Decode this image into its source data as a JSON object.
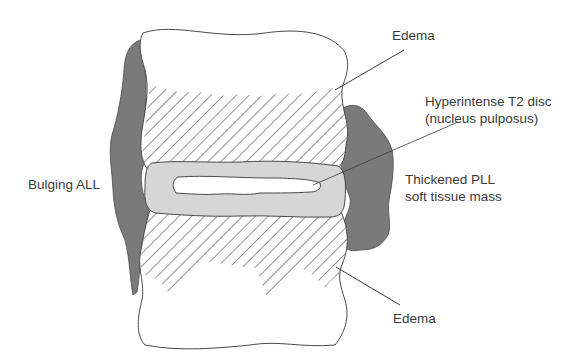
{
  "diagram": {
    "colors": {
      "background": "#ffffff",
      "ligament_dark": "#7a7a7a",
      "disc_annulus": "#d6d6d6",
      "nucleus": "#ffffff",
      "outline": "#4a4a4a",
      "hatch": "#5a5a5a",
      "text": "#3a3a3a"
    },
    "labels": {
      "edema_top": "Edema",
      "hyperintense_line1": "Hyperintense T2 disc",
      "hyperintense_line2": "(nucleus pulposus)",
      "thickened_line1": "Thickened PLL",
      "thickened_line2": "soft tissue mass",
      "bulging_all": "Bulging ALL",
      "edema_bottom": "Edema"
    },
    "structures": [
      "upper-vertebral-body",
      "lower-vertebral-body",
      "intervertebral-disc",
      "nucleus-pulposus",
      "anterior-longitudinal-ligament",
      "posterior-longitudinal-ligament-mass",
      "edema-hatched-region-upper",
      "edema-hatched-region-lower"
    ]
  }
}
